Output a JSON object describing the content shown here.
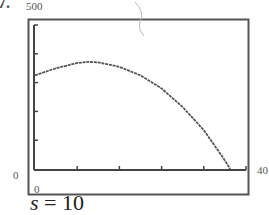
{
  "problem": {
    "number": "7."
  },
  "window": {
    "ymax_label": "500",
    "ymin_label": "0",
    "xmin_label": "0",
    "xmax_label": "40"
  },
  "caption": {
    "variable": "s",
    "equals": " = ",
    "value": "10"
  },
  "chart_data": {
    "type": "line",
    "title": "",
    "xlabel": "",
    "ylabel": "",
    "xlim": [
      0,
      40
    ],
    "ylim": [
      0,
      500
    ],
    "x_ticks": [
      0,
      8,
      16,
      24,
      32,
      40
    ],
    "y_ticks": [
      0,
      100,
      200,
      300,
      400,
      500
    ],
    "grid": false,
    "legend": null,
    "series": [
      {
        "name": "s = 10",
        "x": [
          0,
          4,
          8,
          10,
          12,
          16,
          20,
          24,
          28,
          32,
          36,
          37
        ],
        "y": [
          325,
          350,
          368,
          372,
          370,
          355,
          325,
          280,
          215,
          135,
          30,
          0
        ]
      }
    ],
    "annotations": [
      "s = 10"
    ]
  }
}
